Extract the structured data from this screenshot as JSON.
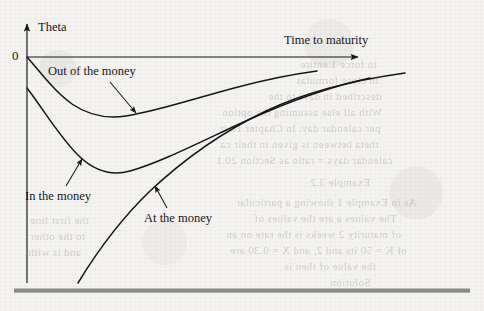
{
  "figure": {
    "axes": {
      "y_axis_label": "Theta",
      "x_axis_label": "Time to maturity",
      "origin_label": "0"
    },
    "annotations": [
      {
        "name": "out-of-the-money",
        "label": "Out of the money"
      },
      {
        "name": "in-the-money",
        "label": "In the money"
      },
      {
        "name": "at-the-money",
        "label": "At the money"
      }
    ],
    "colors": {
      "ink": "#16161a",
      "paper": "#f4f3f1",
      "rule": "#8a8a86"
    }
  },
  "chart_data": {
    "type": "line",
    "title": "",
    "xlabel": "Time to maturity",
    "ylabel": "Theta",
    "xlim": [
      0,
      100
    ],
    "ylim": [
      -100,
      5
    ],
    "grid": false,
    "legend": "annotations-on-curves",
    "axis_style": "arrows",
    "series": [
      {
        "name": "Out of the money",
        "x": [
          0,
          4,
          9,
          15,
          22,
          30,
          40,
          50,
          60,
          72,
          85,
          100
        ],
        "y": [
          0,
          -11,
          -20,
          -27,
          -32,
          -34,
          -32,
          -28,
          -24,
          -20,
          -17,
          -15
        ]
      },
      {
        "name": "In the money",
        "x": [
          0,
          5,
          11,
          18,
          26,
          34,
          42,
          52,
          63,
          75,
          88,
          100
        ],
        "y": [
          -14,
          -30,
          -47,
          -60,
          -67,
          -69,
          -65,
          -57,
          -47,
          -38,
          -31,
          -26
        ]
      },
      {
        "name": "At the money",
        "x": [
          7,
          12,
          18,
          25,
          33,
          42,
          52,
          63,
          75,
          88,
          100
        ],
        "y": [
          -100,
          -92,
          -83,
          -74,
          -65,
          -56,
          -48,
          -41,
          -35,
          -31,
          -28
        ]
      }
    ]
  },
  "ghost_text": [
    {
      "text": "in force 1 entire",
      "x": 300,
      "y": 58
    },
    {
      "text": "in close formulas",
      "x": 296,
      "y": 74
    },
    {
      "text": "described in days to the",
      "x": 268,
      "y": 90
    },
    {
      "text": "With all else assuming the option",
      "x": 222,
      "y": 106
    },
    {
      "text": "per calendar day. In Chapter 18 it",
      "x": 220,
      "y": 122
    },
    {
      "text": "theta between is given in their ca",
      "x": 220,
      "y": 138
    },
    {
      "text": "calendar days = ratio as Section 20.1",
      "x": 216,
      "y": 154
    },
    {
      "text": "Example 3.2",
      "x": 310,
      "y": 176
    },
    {
      "text": "As in Example 1 showing a particular",
      "x": 236,
      "y": 196
    },
    {
      "text": "The values a are the values of",
      "x": 254,
      "y": 212
    },
    {
      "text": "of maturity 2 weeks is the rate on an",
      "x": 226,
      "y": 228
    },
    {
      "text": "of K = 50 its and 2, and X = 0.30 are",
      "x": 230,
      "y": 244
    },
    {
      "text": "the value of then is",
      "x": 284,
      "y": 260
    },
    {
      "text": "Solution",
      "x": 330,
      "y": 276
    },
    {
      "text": "the first line",
      "x": 30,
      "y": 214
    },
    {
      "text": "to the other",
      "x": 30,
      "y": 230
    },
    {
      "text": "and is with",
      "x": 28,
      "y": 246
    }
  ]
}
